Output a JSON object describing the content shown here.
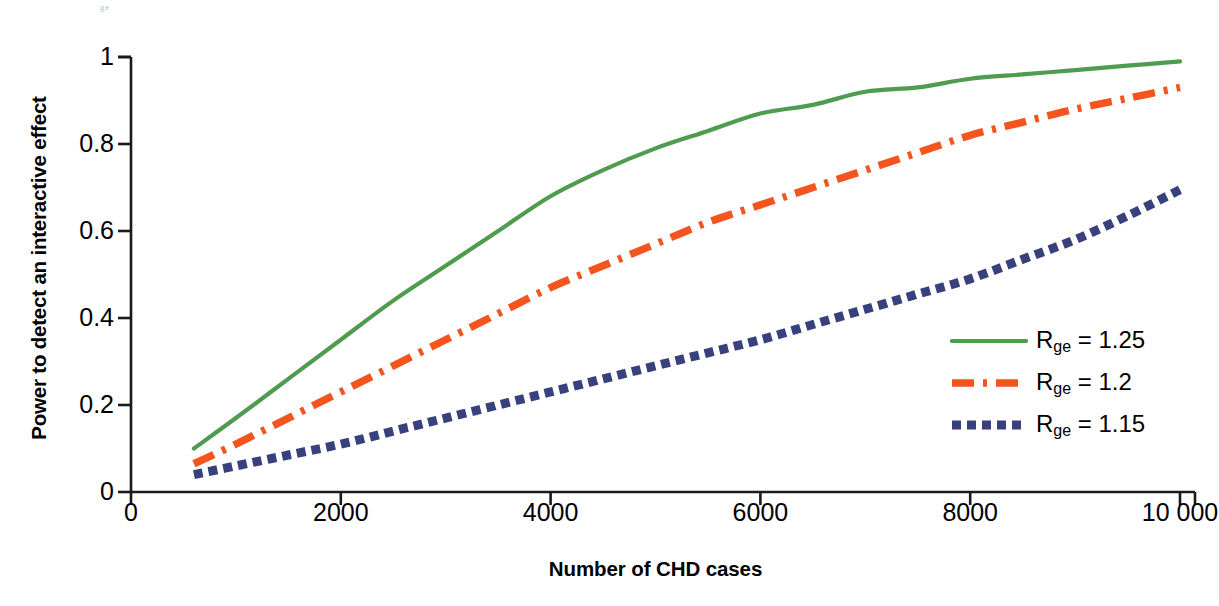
{
  "figure": {
    "top_artifact": "ge",
    "background_color": "#ffffff"
  },
  "axes": {
    "x_title": "Number of CHD cases",
    "y_title": "Power to detect an interactive effect",
    "x_ticks": [
      "0",
      "2000",
      "4000",
      "6000",
      "8000",
      "10 000"
    ],
    "y_ticks": [
      "0",
      "0.2",
      "0.4",
      "0.6",
      "0.8",
      "1"
    ],
    "axis_color": "#1a1a1a"
  },
  "legend": {
    "items": [
      {
        "label_main": "R",
        "label_sub": "ge",
        "label_rest": " = 1.25",
        "color": "#4f9b4f",
        "style": "solid",
        "name": "legend-item-rge-125"
      },
      {
        "label_main": "R",
        "label_sub": "ge",
        "label_rest": " = 1.2",
        "color": "#f4541d",
        "style": "dashdot",
        "name": "legend-item-rge-12"
      },
      {
        "label_main": "R",
        "label_sub": "ge",
        "label_rest": " = 1.15",
        "color": "#38417e",
        "style": "dotted",
        "name": "legend-item-rge-115"
      }
    ]
  },
  "chart_data": {
    "type": "line",
    "title": "",
    "xlabel": "Number of CHD cases",
    "ylabel": "Power to detect an interactive effect",
    "xlim": [
      0,
      10000
    ],
    "ylim": [
      0,
      1
    ],
    "xticks": [
      0,
      2000,
      4000,
      6000,
      8000,
      10000
    ],
    "yticks": [
      0,
      0.2,
      0.4,
      0.6,
      0.8,
      1
    ],
    "grid": false,
    "legend_position": "right-center",
    "x": [
      600,
      1000,
      1500,
      2000,
      2500,
      3000,
      3500,
      4000,
      4500,
      5000,
      5500,
      6000,
      6500,
      7000,
      7500,
      8000,
      8500,
      9000,
      9500,
      10000
    ],
    "series": [
      {
        "name": "R_ge = 1.25",
        "color": "#4f9b4f",
        "style": "solid",
        "values": [
          0.1,
          0.17,
          0.26,
          0.35,
          0.44,
          0.52,
          0.6,
          0.68,
          0.74,
          0.79,
          0.83,
          0.87,
          0.89,
          0.92,
          0.93,
          0.95,
          0.96,
          0.97,
          0.98,
          0.99
        ]
      },
      {
        "name": "R_ge = 1.2",
        "color": "#f4541d",
        "style": "dashdot",
        "values": [
          0.065,
          0.11,
          0.17,
          0.23,
          0.29,
          0.35,
          0.41,
          0.47,
          0.52,
          0.57,
          0.62,
          0.66,
          0.7,
          0.74,
          0.78,
          0.82,
          0.85,
          0.88,
          0.905,
          0.93
        ]
      },
      {
        "name": "R_ge = 1.15",
        "color": "#38417e",
        "style": "dotted",
        "values": [
          0.04,
          0.06,
          0.085,
          0.11,
          0.14,
          0.17,
          0.2,
          0.23,
          0.26,
          0.29,
          0.32,
          0.35,
          0.385,
          0.42,
          0.455,
          0.49,
          0.535,
          0.58,
          0.635,
          0.695
        ]
      }
    ]
  }
}
